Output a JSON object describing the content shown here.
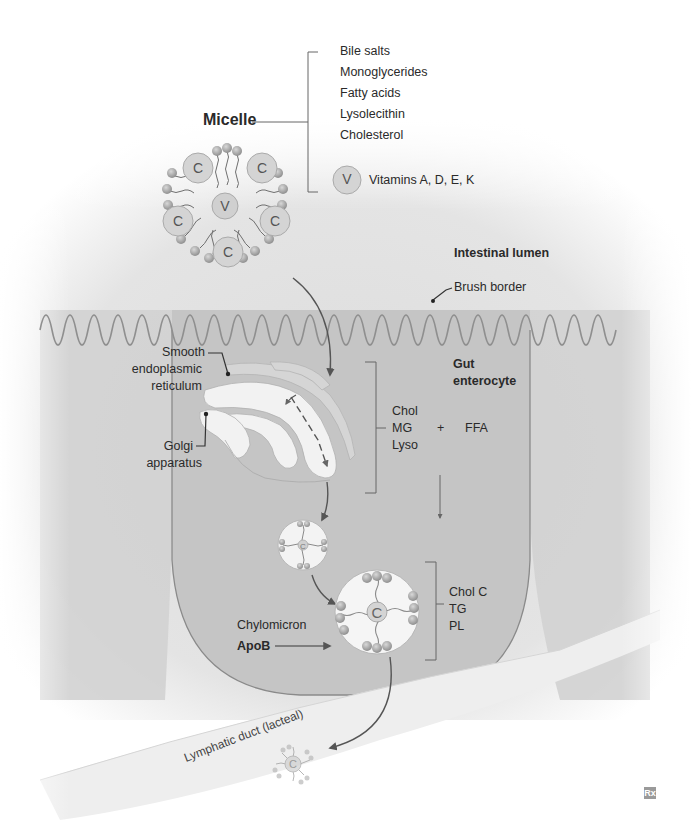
{
  "micelle": {
    "title": "Micelle",
    "components": [
      "Bile salts",
      "Monoglycerides",
      "Fatty acids",
      "Lysolecithin",
      "Cholesterol"
    ],
    "vitamin_symbol": "V",
    "vitamin_label": "Vitamins A, D, E, K",
    "cholesterol_symbol": "C"
  },
  "lumen": {
    "title": "Intestinal lumen",
    "brush_border": "Brush border"
  },
  "enterocyte": {
    "title_line1": "Gut",
    "title_line2": "enterocyte",
    "ser_line1": "Smooth",
    "ser_line2": "endoplasmic",
    "ser_line3": "reticulum",
    "golgi_line1": "Golgi",
    "golgi_line2": "apparatus",
    "absorbed": [
      "Chol",
      "MG",
      "Lyso"
    ],
    "plus": "+",
    "ffa": "FFA",
    "chylomicron_label": "Chylomicron",
    "apob_label": "ApoB",
    "chylo_contents": [
      "Chol C",
      "TG",
      "PL"
    ],
    "chylo_symbol": "C"
  },
  "lymph": {
    "duct_label": "Lymphatic duct (lacteal)"
  },
  "logo": {
    "text": "Rx"
  },
  "colors": {
    "background": "#ffffff",
    "lumen_gray": "#e6e6e6",
    "cell_gray": "#c9c9c9",
    "cell_dark": "#bdbdbd",
    "outline": "#8a8a8a",
    "arrow": "#555555",
    "organelle_white": "#f4f4f4",
    "text": "#2a2a2a"
  }
}
